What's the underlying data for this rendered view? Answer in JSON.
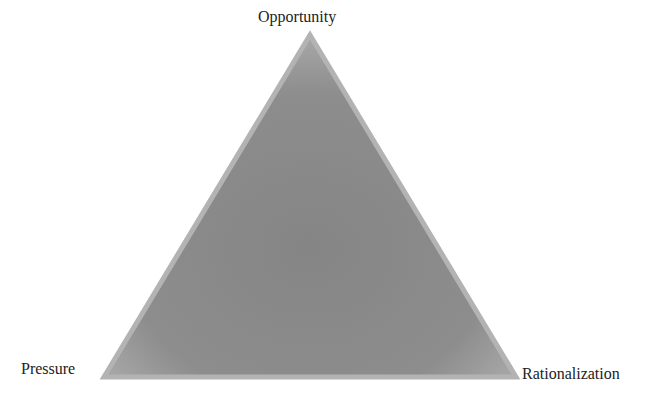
{
  "diagram": {
    "type": "triangle",
    "vertices": {
      "top": {
        "label": "Opportunity"
      },
      "bottom_left": {
        "label": "Pressure"
      },
      "bottom_right": {
        "label": "Rationalization"
      }
    },
    "colors": {
      "fill": "#8a8a8a",
      "edge": "#b0b0b0",
      "text": "#222222",
      "background": "#ffffff"
    }
  }
}
